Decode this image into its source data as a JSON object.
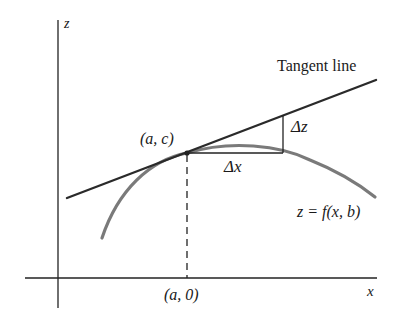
{
  "diagram": {
    "type": "tangent-line-partial-derivative",
    "labels": {
      "z_axis": "z",
      "x_axis": "x",
      "tangent": "Tangent line",
      "point": "(a, c)",
      "foot": "(a, 0)",
      "delta_x": "Δx",
      "delta_z": "Δz",
      "curve": "z = f(x, b)"
    },
    "colors": {
      "axes": "#222222",
      "tangent": "#2a2a2a",
      "curve": "#7a7a7a",
      "text": "#1a1a1a"
    }
  }
}
